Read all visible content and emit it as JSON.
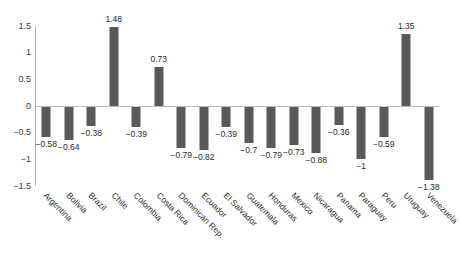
{
  "chart_data": {
    "type": "bar",
    "title": "",
    "subtitle": "",
    "xlabel": "",
    "ylabel": "",
    "ylim": [
      -1.5,
      1.5
    ],
    "yticks": [
      "1.5",
      "1",
      "0.5",
      "0",
      "-0.5",
      "-1",
      "-1.5"
    ],
    "ytick_values": [
      1.5,
      1,
      0.5,
      0,
      -0.5,
      -1,
      -1.5
    ],
    "grid": false,
    "legend": false,
    "bar_color": "#595959",
    "axis_color": "#bdbdbd",
    "categories": [
      "Argentina",
      "Bolivia",
      "Brazil",
      "Chile",
      "Colombia",
      "Costa Rica",
      "Dominican Rep.",
      "Ecuador",
      "El Salvador",
      "Guatemala",
      "Honduras",
      "Mexico",
      "Nicaragua",
      "Panama",
      "Paraguay",
      "Peru",
      "Uruguay",
      "Venezuela"
    ],
    "values": [
      -0.58,
      -0.64,
      -0.38,
      1.48,
      -0.39,
      0.73,
      -0.79,
      -0.82,
      -0.39,
      -0.7,
      -0.79,
      -0.73,
      -0.88,
      -0.36,
      -1,
      -0.59,
      1.35,
      -1.38
    ],
    "value_labels": [
      "−0.58",
      "−0.64",
      "−0.38",
      "1.48",
      "−0.39",
      "0.73",
      "−0.79",
      "−0.82",
      "−0.39",
      "−0.7",
      "−0.79",
      "−0.73",
      "−0.88",
      "−0.36",
      "−1",
      "−0.59",
      "1.35",
      "−1.38"
    ]
  }
}
